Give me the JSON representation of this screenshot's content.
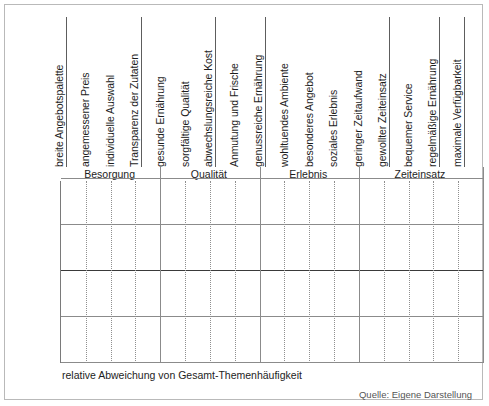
{
  "figure": {
    "x_caption": "relative Abweichung von Gesamt-Themenhäufigkeit",
    "source_note": "Quelle: Eigene Darstellung"
  },
  "chart_data": {
    "type": "bar",
    "title": "",
    "subtitle": "",
    "xlabel": "relative Abweichung von Gesamt-Themenhäufigkeit",
    "ylabel": "",
    "ylim": [
      -100,
      100
    ],
    "yticks": [
      100,
      50,
      0,
      -50,
      -100
    ],
    "ytick_labels": [
      "100 %",
      "50 %",
      "0 %",
      "-50 %",
      "-100 %"
    ],
    "grid": "horizontal gridlines at -50/0/50/100, dotted vertical separators between categories",
    "legend": "none",
    "orientation": "vertical",
    "bar_color": "#141414",
    "unit": "%",
    "categories": [
      "breite Angebotspalette",
      "angemessener Preis",
      "individuelle Auswahl",
      "Transparenz der Zutaten",
      "gesunde Ernährung",
      "sorgfältige Qualität",
      "abwechslungsreiche Kost",
      "Anmutung und Frische",
      "genussreiche Ernährung",
      "wohltuendes Ambiente",
      "besonderes Angebot",
      "soziales Erlebnis",
      "geringer Zeitaufwand",
      "gewollter Zeiteinsatz",
      "bequemer Service",
      "regelmäßige Ernährung",
      "maximale Verfügbarkeit"
    ],
    "values": [
      28,
      7,
      8,
      -26,
      -12,
      22,
      1,
      -8,
      -3,
      62,
      67,
      -8,
      -50,
      95,
      -65,
      38,
      -73
    ],
    "groups": [
      {
        "label": "Besorgung",
        "start": 0,
        "count": 4
      },
      {
        "label": "Qualität",
        "start": 4,
        "count": 4
      },
      {
        "label": "Erlebnis",
        "start": 8,
        "count": 4
      },
      {
        "label": "Zeiteinsatz",
        "start": 12,
        "count": 5
      }
    ]
  }
}
